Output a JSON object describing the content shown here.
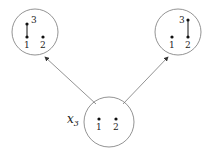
{
  "diagram": {
    "nodes": [
      {
        "id": "left",
        "cx": 35,
        "cy": 32,
        "r": 23,
        "points": [
          {
            "label": "1",
            "x": 27,
            "y": 37,
            "lx": 24,
            "ly": 48
          },
          {
            "label": "3",
            "x": 27,
            "y": 24,
            "lx": 31,
            "ly": 23
          },
          {
            "label": "2",
            "x": 43,
            "y": 37,
            "lx": 40,
            "ly": 48
          }
        ],
        "edges": [
          [
            "1",
            "3"
          ]
        ]
      },
      {
        "id": "right",
        "cx": 178,
        "cy": 32,
        "r": 23,
        "points": [
          {
            "label": "1",
            "x": 172,
            "y": 37,
            "lx": 169,
            "ly": 48
          },
          {
            "label": "2",
            "x": 188,
            "y": 37,
            "lx": 185,
            "ly": 48
          },
          {
            "label": "3",
            "x": 188,
            "y": 20,
            "lx": 179,
            "ly": 23
          }
        ],
        "edges": [
          [
            "2",
            "3"
          ]
        ]
      },
      {
        "id": "bottom",
        "cx": 109,
        "cy": 122,
        "r": 25,
        "label": "x",
        "label_sub": "3",
        "points": [
          {
            "label": "1",
            "x": 99,
            "y": 119,
            "lx": 96,
            "ly": 130
          },
          {
            "label": "2",
            "x": 116,
            "y": 119,
            "lx": 113,
            "ly": 130
          }
        ],
        "edges": []
      }
    ],
    "arrows": [
      {
        "from": "bottom",
        "to": "left",
        "x1": 96,
        "y1": 104,
        "x2": 45,
        "y2": 57
      },
      {
        "from": "bottom",
        "to": "right",
        "x1": 123,
        "y1": 104,
        "x2": 168,
        "y2": 57
      }
    ],
    "colors": {
      "stroke": "#777777",
      "dot": "#111111",
      "text": "#222222"
    }
  }
}
